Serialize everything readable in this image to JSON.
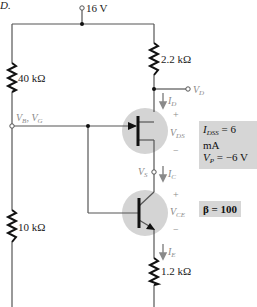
{
  "header": {
    "fragment": "D."
  },
  "supply": {
    "label": "16 V"
  },
  "resistors": {
    "r1": {
      "label": "40 kΩ"
    },
    "r2": {
      "label": "10 kΩ"
    },
    "rd": {
      "label": "2.2 kΩ"
    },
    "re": {
      "label": "1.2 kΩ"
    }
  },
  "nodes": {
    "vd": {
      "main": "V",
      "sub": "D"
    },
    "vbvg": {
      "v1": "V",
      "s1": "B",
      "sep": ", ",
      "v2": "V",
      "s2": "G"
    },
    "vs": {
      "main": "V",
      "sub": "S"
    }
  },
  "currents": {
    "id": {
      "main": "I",
      "sub": "D"
    },
    "ic": {
      "main": "I",
      "sub": "C"
    },
    "ie": {
      "main": "I",
      "sub": "E"
    }
  },
  "voltages": {
    "vds": {
      "plus": "+",
      "main": "V",
      "sub": "DS",
      "minus": "−"
    },
    "vce": {
      "plus": "+",
      "main": "V",
      "sub": "CE",
      "minus": "−"
    }
  },
  "jfet_params": {
    "idss": {
      "main": "I",
      "sub": "DSS",
      "value": " = 6 mA"
    },
    "vp": {
      "main": "V",
      "sub": "P",
      "value": " = −6 V"
    }
  },
  "bjt_params": {
    "beta": "β = 100"
  },
  "colors": {
    "wire": "#555555",
    "resistor": "#111111",
    "device_fill": "#d4d4d4",
    "param_box": "#d6d6d6",
    "annotation": "#8a8a8a"
  }
}
